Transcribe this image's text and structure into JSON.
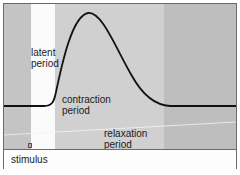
{
  "diagram": {
    "labels": {
      "latent": "latent\nperiod",
      "contraction": "contraction\nperiod",
      "relaxation": "relaxation\nperiod",
      "stimulus": "stimulus"
    },
    "regions": [
      {
        "name": "pre-stimulus",
        "color": "#c4c4c4"
      },
      {
        "name": "latent period",
        "color": "#fbfbfb"
      },
      {
        "name": "contraction + relaxation",
        "color": "#d0d0d0"
      },
      {
        "name": "post-twitch",
        "color": "#bebebe"
      }
    ],
    "curve_color": "#111111"
  }
}
